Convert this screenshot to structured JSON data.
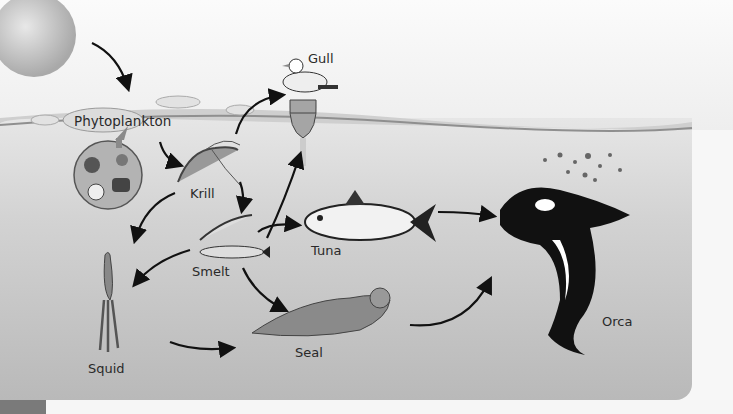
{
  "diagram": {
    "type": "marine food web",
    "nodes": [
      {
        "id": "phytoplankton",
        "label": "Phytoplankton"
      },
      {
        "id": "krill",
        "label": "Krill"
      },
      {
        "id": "gull",
        "label": "Gull"
      },
      {
        "id": "smelt",
        "label": "Smelt"
      },
      {
        "id": "tuna",
        "label": "Tuna"
      },
      {
        "id": "squid",
        "label": "Squid"
      },
      {
        "id": "seal",
        "label": "Seal"
      },
      {
        "id": "orca",
        "label": "Orca"
      }
    ],
    "edges": [
      {
        "from": "sun",
        "to": "phytoplankton"
      },
      {
        "from": "phytoplankton",
        "to": "krill"
      },
      {
        "from": "krill",
        "to": "gull"
      },
      {
        "from": "krill",
        "to": "smelt"
      },
      {
        "from": "krill",
        "to": "squid"
      },
      {
        "from": "smelt",
        "to": "gull"
      },
      {
        "from": "smelt",
        "to": "tuna"
      },
      {
        "from": "smelt",
        "to": "squid"
      },
      {
        "from": "smelt",
        "to": "seal"
      },
      {
        "from": "squid",
        "to": "seal"
      },
      {
        "from": "tuna",
        "to": "orca"
      },
      {
        "from": "seal",
        "to": "orca"
      }
    ]
  },
  "labels": {
    "phytoplankton": "Phytoplankton",
    "krill": "Krill",
    "gull": "Gull",
    "smelt": "Smelt",
    "tuna": "Tuna",
    "squid": "Squid",
    "seal": "Seal",
    "orca": "Orca"
  }
}
